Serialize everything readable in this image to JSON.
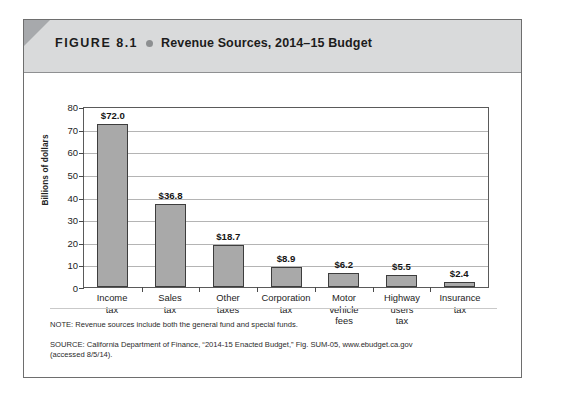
{
  "figure": {
    "number": "FIGURE 8.1",
    "bullet_icon": "bullet-dot-icon",
    "title": "Revenue Sources, 2014–15 Budget",
    "header_background": "#d9dadb",
    "corner_color": "#a7a9ac"
  },
  "chart_data": {
    "type": "bar",
    "title": "Revenue Sources, 2014–15 Budget",
    "categories": [
      "Income tax",
      "Sales tax",
      "Other taxes",
      "Corporation tax",
      "Motor vehicle fees",
      "Highway users tax",
      "Insurance tax"
    ],
    "category_lines": [
      [
        "Income",
        "tax"
      ],
      [
        "Sales",
        "tax"
      ],
      [
        "Other",
        "taxes"
      ],
      [
        "Corporation",
        "tax"
      ],
      [
        "Motor",
        "vehicle",
        "fees"
      ],
      [
        "Highway",
        "users",
        "tax"
      ],
      [
        "Insurance",
        "tax"
      ]
    ],
    "values": [
      72.0,
      36.8,
      18.7,
      8.9,
      6.2,
      5.5,
      2.4
    ],
    "data_labels": [
      "$72.0",
      "$36.8",
      "$18.7",
      "$8.9",
      "$6.2",
      "$5.5",
      "$2.4"
    ],
    "xlabel": "",
    "ylabel": "Billions of dollars",
    "ylim": [
      0,
      80
    ],
    "ytick_values": [
      0,
      10,
      20,
      30,
      40,
      50,
      60,
      70,
      80
    ],
    "ytick_labels": [
      "0",
      "10",
      "20",
      "30",
      "40",
      "50",
      "60",
      "70",
      "80"
    ],
    "grid": true,
    "legend": false,
    "bar_color": "#a9a9a9",
    "bar_border_color": "#3d3d3d"
  },
  "notes": {
    "note": "NOTE: Revenue sources include both the general fund and special funds.",
    "source": "SOURCE: California Department of Finance, “2014-15 Enacted Budget,” Fig. SUM-05, www.ebudget.ca.gov",
    "accessed": "(accessed 8/5/14)."
  }
}
